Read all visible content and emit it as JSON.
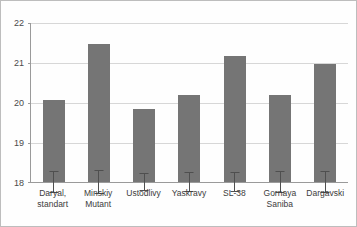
{
  "chart_data": {
    "type": "bar",
    "title": "",
    "subtitle": "",
    "xlabel": "",
    "ylabel": "",
    "ylim": [
      18,
      22
    ],
    "yticks": [
      18,
      19,
      20,
      21,
      22
    ],
    "grid": true,
    "legend": null,
    "bar_color": "#757575",
    "errorbar_color": "#4f4f4f",
    "gridline_color": "#d7d7d7",
    "axis_color": "#9a9a9a",
    "categories": [
      "Daryal, standart",
      "Minskiy Mutant",
      "Ustodlivy",
      "Yaskravy",
      "SL-38",
      "Gornaya Saniba",
      "Dargavski"
    ],
    "category_lines": [
      [
        "Daryal,",
        "standart"
      ],
      [
        "Minskiy",
        "Mutant"
      ],
      [
        "Ustodlivy",
        ""
      ],
      [
        "Yaskravy",
        ""
      ],
      [
        "SL-38",
        ""
      ],
      [
        "Gornaya",
        "Saniba"
      ],
      [
        "Dargavski",
        ""
      ]
    ],
    "values": [
      20.05,
      21.45,
      19.82,
      20.18,
      21.15,
      20.18,
      20.95
    ],
    "errors": [
      0.28,
      0.3,
      0.22,
      0.25,
      0.25,
      0.28,
      0.27
    ],
    "series": [
      {
        "name": "Mean value",
        "values": [
          20.05,
          21.45,
          19.82,
          20.18,
          21.15,
          20.18,
          20.95
        ],
        "errors": [
          0.28,
          0.3,
          0.22,
          0.25,
          0.25,
          0.28,
          0.27
        ]
      }
    ]
  },
  "axis": {
    "y_tick_labels": [
      "22",
      "21",
      "20",
      "19",
      "18"
    ]
  }
}
